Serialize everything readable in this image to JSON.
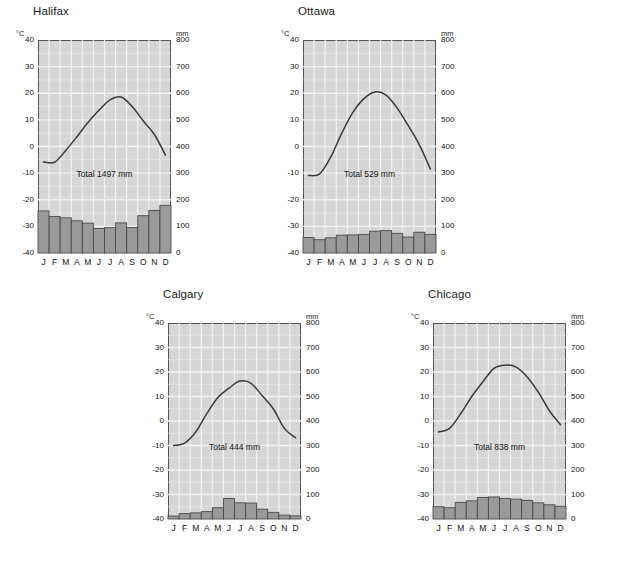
{
  "figure": {
    "background_color": "#ffffff",
    "plot_background_color": "#d6d6d6",
    "grid_color": "#f2f2f2",
    "bar_color": "#9a9a9a",
    "bar_edge_color": "#4a4a4a",
    "curve_color": "#3a3a3a",
    "axis_color": "#555555",
    "text_color": "#111111"
  },
  "axes": {
    "temp_unit": "°C",
    "precip_unit": "mm",
    "temp_ticks": [
      40,
      30,
      20,
      10,
      0,
      -10,
      -20,
      -30,
      -40
    ],
    "temp_tick_labels": [
      "40",
      "30",
      "20",
      "10",
      "0",
      "-10",
      "-20",
      "-30",
      "-40"
    ],
    "precip_ticks": [
      800,
      700,
      600,
      500,
      400,
      300,
      200,
      100,
      0
    ],
    "precip_tick_labels": [
      "800",
      "700",
      "600",
      "500",
      "400",
      "300",
      "200",
      "100",
      "0"
    ],
    "temp_range": [
      -40,
      40
    ],
    "precip_range": [
      0,
      800
    ],
    "months": [
      "J",
      "F",
      "M",
      "A",
      "M",
      "J",
      "J",
      "A",
      "S",
      "O",
      "N",
      "D"
    ],
    "grid": true
  },
  "chart_data": [
    {
      "type": "bar",
      "title": "Halifax",
      "xlabel": "",
      "ylabel": "°C",
      "ylabel_right": "mm",
      "ylim": [
        -40,
        40
      ],
      "ylim_right": [
        0,
        800
      ],
      "categories": [
        "J",
        "F",
        "M",
        "A",
        "M",
        "J",
        "J",
        "A",
        "S",
        "O",
        "N",
        "D"
      ],
      "annotation": "Total 1497 mm",
      "annotation_value": 1497,
      "series": [
        {
          "name": "Precipitation",
          "unit": "mm",
          "axis": "right",
          "render": "bar",
          "values": [
            158,
            137,
            132,
            121,
            112,
            92,
            95,
            113,
            96,
            140,
            160,
            179
          ]
        },
        {
          "name": "Temperature",
          "unit": "°C",
          "axis": "left",
          "render": "line",
          "values": [
            -5.8,
            -5.9,
            -1.5,
            3.6,
            9.0,
            13.6,
            17.5,
            18.6,
            15.0,
            9.6,
            4.5,
            -3.2
          ]
        }
      ]
    },
    {
      "type": "bar",
      "title": "Ottawa",
      "xlabel": "",
      "ylabel": "°C",
      "ylabel_right": "mm",
      "ylim": [
        -40,
        40
      ],
      "ylim_right": [
        0,
        800
      ],
      "categories": [
        "J",
        "F",
        "M",
        "A",
        "M",
        "J",
        "J",
        "A",
        "S",
        "O",
        "N",
        "D"
      ],
      "annotation": "Total 529 mm",
      "annotation_value": 529,
      "series": [
        {
          "name": "Precipitation",
          "unit": "mm",
          "axis": "right",
          "render": "bar",
          "values": [
            58,
            50,
            57,
            67,
            68,
            70,
            82,
            84,
            74,
            60,
            78,
            70
          ]
        },
        {
          "name": "Temperature",
          "unit": "°C",
          "axis": "left",
          "render": "line",
          "values": [
            -10.9,
            -10.3,
            -4.0,
            5.0,
            12.8,
            18.0,
            20.5,
            19.3,
            14.4,
            7.8,
            0.6,
            -8.5
          ]
        }
      ]
    },
    {
      "type": "bar",
      "title": "Calgary",
      "xlabel": "",
      "ylabel": "°C",
      "ylabel_right": "mm",
      "ylim": [
        -40,
        40
      ],
      "ylim_right": [
        0,
        800
      ],
      "categories": [
        "J",
        "F",
        "M",
        "A",
        "M",
        "J",
        "J",
        "A",
        "S",
        "O",
        "N",
        "D"
      ],
      "annotation": "Total 444 mm",
      "annotation_value": 444,
      "series": [
        {
          "name": "Precipitation",
          "unit": "mm",
          "axis": "right",
          "render": "bar",
          "values": [
            12,
            22,
            25,
            30,
            46,
            84,
            66,
            65,
            40,
            27,
            16,
            13
          ]
        },
        {
          "name": "Temperature",
          "unit": "°C",
          "axis": "left",
          "render": "line",
          "values": [
            -10.0,
            -9.0,
            -4.5,
            3.0,
            9.6,
            13.4,
            16.3,
            15.4,
            10.3,
            5.0,
            -3.0,
            -6.8
          ]
        }
      ]
    },
    {
      "type": "bar",
      "title": "Chicago",
      "xlabel": "",
      "ylabel": "°C",
      "ylabel_right": "mm",
      "ylim": [
        -40,
        40
      ],
      "ylim_right": [
        0,
        800
      ],
      "categories": [
        "J",
        "F",
        "M",
        "A",
        "M",
        "J",
        "J",
        "A",
        "S",
        "O",
        "N",
        "D"
      ],
      "annotation": "Total 838 mm",
      "annotation_value": 838,
      "series": [
        {
          "name": "Precipitation",
          "unit": "mm",
          "axis": "right",
          "render": "bar",
          "values": [
            50,
            46,
            68,
            74,
            88,
            90,
            84,
            81,
            76,
            66,
            58,
            52
          ]
        },
        {
          "name": "Temperature",
          "unit": "°C",
          "axis": "left",
          "render": "line",
          "values": [
            -4.5,
            -3.0,
            3.0,
            10.0,
            16.0,
            21.5,
            22.8,
            22.0,
            18.0,
            11.8,
            4.2,
            -1.5
          ]
        }
      ]
    }
  ],
  "panels": [
    {
      "left": 8,
      "top": 5,
      "plot_left": 30,
      "plot_top": 35,
      "plot_w": 133,
      "plot_h": 213,
      "title_left": 25
    },
    {
      "left": 273,
      "top": 5,
      "plot_left": 30,
      "plot_top": 35,
      "plot_w": 133,
      "plot_h": 213,
      "title_left": 25
    },
    {
      "left": 138,
      "top": 288,
      "plot_left": 30,
      "plot_top": 35,
      "plot_w": 133,
      "plot_h": 196,
      "title_left": 25
    },
    {
      "left": 403,
      "top": 288,
      "plot_left": 30,
      "plot_top": 35,
      "plot_w": 133,
      "plot_h": 196,
      "title_left": 25
    }
  ]
}
